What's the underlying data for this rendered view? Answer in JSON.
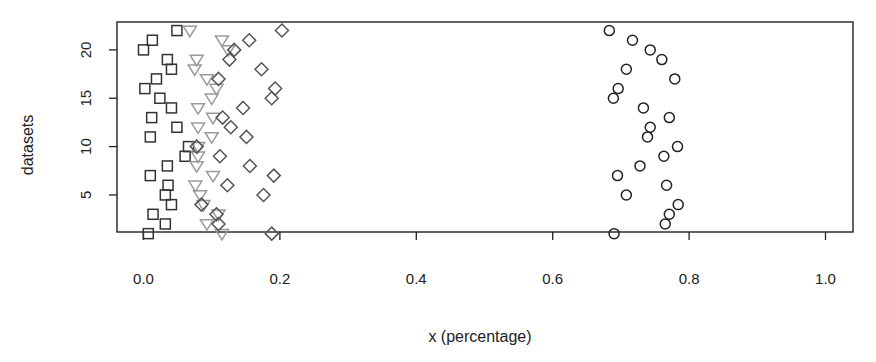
{
  "chart_data": {
    "type": "scatter",
    "title": "",
    "xlabel": "x (percentage)",
    "ylabel": "datasets",
    "xlim": [
      -0.04,
      1.04
    ],
    "ylim": [
      0.2,
      22.6
    ],
    "xticks": [
      0.0,
      0.2,
      0.4,
      0.6,
      0.8,
      1.0
    ],
    "xtick_labels": [
      "0.0",
      "0.2",
      "0.4",
      "0.6",
      "0.8",
      "1.0"
    ],
    "yticks": [
      5,
      10,
      15,
      20
    ],
    "ytick_labels": [
      "5",
      "10",
      "15",
      "20"
    ],
    "grid": false,
    "legend": null,
    "y": [
      1,
      2,
      3,
      4,
      5,
      6,
      7,
      8,
      9,
      10,
      11,
      12,
      13,
      14,
      15,
      16,
      17,
      18,
      19,
      20,
      21,
      22
    ],
    "series": [
      {
        "name": "square",
        "marker": "square",
        "color": "#333333",
        "values": [
          0.007,
          0.032,
          0.014,
          0.041,
          0.032,
          0.036,
          0.01,
          0.035,
          0.061,
          0.066,
          0.01,
          0.049,
          0.012,
          0.041,
          0.024,
          0.002,
          0.019,
          0.041,
          0.035,
          0.0,
          0.013,
          0.049
        ]
      },
      {
        "name": "triangle",
        "marker": "triangle-down",
        "color": "#9a9a9a",
        "values": [
          0.115,
          0.093,
          0.11,
          0.088,
          0.083,
          0.076,
          0.102,
          0.078,
          0.08,
          0.08,
          0.1,
          0.08,
          0.102,
          0.08,
          0.1,
          0.107,
          0.093,
          0.075,
          0.078,
          0.124,
          0.115,
          0.068
        ]
      },
      {
        "name": "diamond",
        "marker": "diamond",
        "color": "#555555",
        "values": [
          0.188,
          0.11,
          0.107,
          0.085,
          0.176,
          0.123,
          0.191,
          0.156,
          0.112,
          0.078,
          0.151,
          0.128,
          0.116,
          0.146,
          0.188,
          0.193,
          0.11,
          0.173,
          0.126,
          0.133,
          0.155,
          0.203
        ]
      },
      {
        "name": "circle",
        "marker": "circle",
        "color": "#222222",
        "values": [
          0.69,
          0.765,
          0.771,
          0.784,
          0.708,
          0.767,
          0.695,
          0.728,
          0.763,
          0.783,
          0.739,
          0.743,
          0.771,
          0.733,
          0.689,
          0.696,
          0.779,
          0.708,
          0.76,
          0.743,
          0.717,
          0.683
        ]
      }
    ]
  }
}
